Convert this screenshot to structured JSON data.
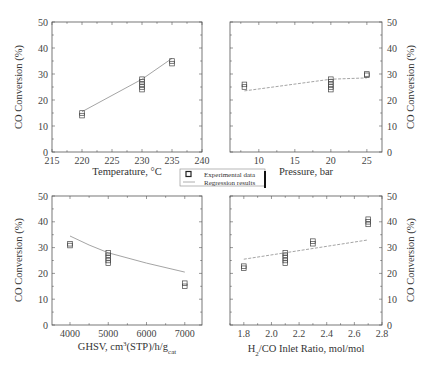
{
  "legend": {
    "items": [
      {
        "label": "Experimental data",
        "marker": "square-open"
      },
      {
        "label": "Regression results",
        "marker": "line"
      }
    ]
  },
  "colors": {
    "axis": "#555555",
    "marker": "#444444",
    "regression_line": "#9a9a9a"
  },
  "chart_data": [
    {
      "type": "scatter",
      "id": "temperature",
      "title": "",
      "xlabel": "Temperature, °C",
      "ylabel": "CO Conversion (%)",
      "ylabel_side": "left",
      "xlim": [
        215,
        240
      ],
      "ylim": [
        0,
        50
      ],
      "xticks": [
        215,
        220,
        225,
        230,
        235,
        240
      ],
      "yticks": [
        0,
        10,
        20,
        30,
        40,
        50
      ],
      "series": [
        {
          "name": "Experimental data",
          "kind": "scatter",
          "points": [
            [
              220,
              15
            ],
            [
              220,
              14
            ],
            [
              230,
              28
            ],
            [
              230,
              27
            ],
            [
              230,
              26
            ],
            [
              230,
              25
            ],
            [
              230,
              24
            ],
            [
              235,
              35
            ],
            [
              235,
              34
            ]
          ]
        },
        {
          "name": "Regression results",
          "kind": "line",
          "points": [
            [
              220,
              15.5
            ],
            [
              230,
              28
            ],
            [
              235,
              36
            ]
          ]
        }
      ]
    },
    {
      "type": "scatter",
      "id": "pressure",
      "title": "",
      "xlabel": "Pressure, bar",
      "ylabel": "CO Conversion (%)",
      "ylabel_side": "right",
      "xlim": [
        6,
        27.1
      ],
      "ylim": [
        0,
        50
      ],
      "xticks": [
        10,
        15,
        20,
        25
      ],
      "yticks": [
        0,
        10,
        20,
        30,
        40,
        50
      ],
      "series": [
        {
          "name": "Experimental data",
          "kind": "scatter",
          "points": [
            [
              8,
              26
            ],
            [
              8,
              25
            ],
            [
              20,
              28
            ],
            [
              20,
              27
            ],
            [
              20,
              26
            ],
            [
              20,
              25
            ],
            [
              20,
              24
            ],
            [
              25,
              30
            ],
            [
              25,
              29.5
            ]
          ]
        },
        {
          "name": "Regression results",
          "kind": "line",
          "points": [
            [
              8,
              23.5
            ],
            [
              20,
              28
            ],
            [
              25,
              28.5
            ]
          ]
        }
      ]
    },
    {
      "type": "scatter",
      "id": "ghsv",
      "title": "",
      "xlabel": "GHSV, cm³(STP)/h/g_cat",
      "xlabel_main": "GHSV, cm",
      "xlabel_sup": "3",
      "xlabel_mid": "(STP)/h/g",
      "xlabel_sub": "cat",
      "ylabel": "CO Conversion (%)",
      "ylabel_side": "left",
      "xlim": [
        3530,
        7450
      ],
      "ylim": [
        0,
        50
      ],
      "xticks": [
        4000,
        5000,
        6000,
        7000
      ],
      "yticks": [
        0,
        10,
        20,
        30,
        40,
        50
      ],
      "series": [
        {
          "name": "Experimental data",
          "kind": "scatter",
          "points": [
            [
              4000,
              31.5
            ],
            [
              4000,
              30.8
            ],
            [
              5000,
              28
            ],
            [
              5000,
              27
            ],
            [
              5000,
              26
            ],
            [
              5000,
              25
            ],
            [
              5000,
              24
            ],
            [
              7000,
              16.2
            ],
            [
              7000,
              15
            ]
          ]
        },
        {
          "name": "Regression results",
          "kind": "line",
          "points": [
            [
              4000,
              34.5
            ],
            [
              4500,
              31
            ],
            [
              5000,
              28
            ],
            [
              6000,
              24
            ],
            [
              7000,
              20.5
            ]
          ]
        }
      ]
    },
    {
      "type": "scatter",
      "id": "h2co",
      "title": "",
      "xlabel": "H₂/CO Inlet Ratio, mol/mol",
      "xlabel_pre": "H",
      "xlabel_sub": "2",
      "xlabel_post": "/CO Inlet Ratio, mol/mol",
      "ylabel": "CO Conversion (%)",
      "ylabel_side": "right",
      "xlim": [
        1.7,
        2.8
      ],
      "ylim": [
        0,
        50
      ],
      "xticks": [
        "1.8",
        "2.0",
        "2.2",
        "2.4",
        "2.6",
        "2.8"
      ],
      "yticks": [
        0,
        10,
        20,
        30,
        40,
        50
      ],
      "series": [
        {
          "name": "Experimental data",
          "kind": "scatter",
          "points": [
            [
              1.8,
              22.8
            ],
            [
              1.8,
              22
            ],
            [
              2.1,
              28
            ],
            [
              2.1,
              27
            ],
            [
              2.1,
              26
            ],
            [
              2.1,
              25
            ],
            [
              2.1,
              24
            ],
            [
              2.3,
              32.5
            ],
            [
              2.3,
              31.5
            ],
            [
              2.7,
              41
            ],
            [
              2.7,
              40
            ],
            [
              2.7,
              39
            ]
          ]
        },
        {
          "name": "Regression results",
          "kind": "line",
          "points": [
            [
              1.8,
              25.5
            ],
            [
              2.7,
              33
            ]
          ]
        }
      ]
    }
  ]
}
